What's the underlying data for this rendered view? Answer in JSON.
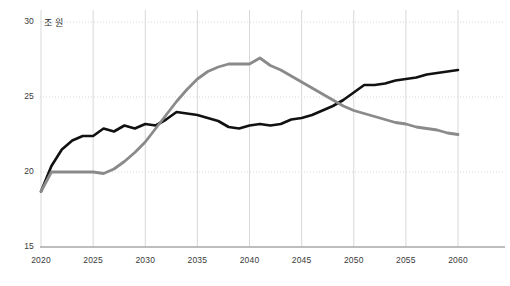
{
  "chart_data": {
    "type": "line",
    "title": "",
    "subtitle": "",
    "xlabel": "",
    "ylabel": "",
    "unit_label": "조 원",
    "xlim": [
      2020,
      2060
    ],
    "ylim": [
      15,
      30
    ],
    "xticks": [
      2020,
      2025,
      2030,
      2035,
      2040,
      2045,
      2050,
      2055,
      2060
    ],
    "yticks": [
      15,
      20,
      25,
      30
    ],
    "grid": true,
    "legend": "none",
    "x": [
      2020,
      2021,
      2022,
      2023,
      2024,
      2025,
      2026,
      2027,
      2028,
      2029,
      2030,
      2031,
      2032,
      2033,
      2034,
      2035,
      2036,
      2037,
      2038,
      2039,
      2040,
      2041,
      2042,
      2043,
      2044,
      2045,
      2046,
      2047,
      2048,
      2049,
      2050,
      2051,
      2052,
      2053,
      2054,
      2055,
      2056,
      2057,
      2058,
      2059,
      2060
    ],
    "series": [
      {
        "name": "series-black",
        "color": "#111111",
        "width": 2.6,
        "values": [
          18.7,
          20.4,
          21.5,
          22.1,
          22.4,
          22.4,
          22.9,
          22.7,
          23.1,
          22.9,
          23.2,
          23.1,
          23.5,
          24.0,
          23.9,
          23.8,
          23.6,
          23.4,
          23.0,
          22.9,
          23.1,
          23.2,
          23.1,
          23.2,
          23.5,
          23.6,
          23.8,
          24.1,
          24.4,
          24.8,
          25.3,
          25.8,
          25.8,
          25.9,
          26.1,
          26.2,
          26.3,
          26.5,
          26.6,
          26.7,
          26.8
        ]
      },
      {
        "name": "series-gray",
        "color": "#8a8a8a",
        "width": 2.8,
        "values": [
          18.7,
          20.0,
          20.0,
          20.0,
          20.0,
          20.0,
          19.9,
          20.2,
          20.7,
          21.3,
          22.0,
          22.9,
          23.8,
          24.7,
          25.5,
          26.2,
          26.7,
          27.0,
          27.2,
          27.2,
          27.2,
          27.6,
          27.1,
          26.8,
          26.4,
          26.0,
          25.6,
          25.2,
          24.8,
          24.4,
          24.1,
          23.9,
          23.7,
          23.5,
          23.3,
          23.2,
          23.0,
          22.9,
          22.8,
          22.6,
          22.5
        ]
      }
    ],
    "axis_color": "#999999",
    "grid_color": "#d8d8d8"
  }
}
